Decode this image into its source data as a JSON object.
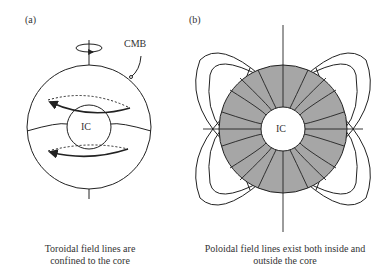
{
  "panels": [
    {
      "id": "a",
      "label": "(a)",
      "callout": "CMB",
      "inner_core": "IC",
      "caption_line1": "Toroidal field lines are",
      "caption_line2": "confined to the core"
    },
    {
      "id": "b",
      "label": "(b)",
      "inner_core": "IC",
      "caption_line1": "Poloidal field lines exist both inside and",
      "caption_line2": "outside the core"
    }
  ],
  "colors": {
    "line": "#222222",
    "outer_core_fill": "#a6a6a6",
    "background": "#ffffff"
  }
}
